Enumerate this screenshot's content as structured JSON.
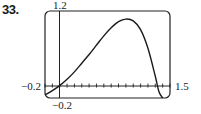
{
  "problem_number": "33.",
  "chart_data": {
    "type": "line",
    "title": "",
    "xlabel": "",
    "ylabel": "",
    "xlim": [
      -0.2,
      1.5
    ],
    "ylim": [
      -0.2,
      1.2
    ],
    "tick_labels": {
      "y_max": "1.2",
      "x_min": "-0.2",
      "x_max": "1.5",
      "y_min": "-0.2"
    },
    "x_tick_step": 0.1,
    "grid": false,
    "legend": null,
    "series": [
      {
        "name": "f(x)",
        "x": [
          -0.2,
          -0.1,
          0.0,
          0.1,
          0.2,
          0.3,
          0.4,
          0.5,
          0.6,
          0.7,
          0.8,
          0.9,
          1.0,
          1.1,
          1.2,
          1.3,
          1.35,
          1.4
        ],
        "y": [
          -0.15,
          -0.08,
          0.0,
          0.1,
          0.22,
          0.36,
          0.5,
          0.65,
          0.8,
          0.93,
          1.03,
          1.07,
          1.04,
          0.9,
          0.6,
          0.15,
          -0.1,
          -0.2
        ]
      }
    ]
  },
  "labels": {
    "y_top": "1.2",
    "x_left": "−0.2",
    "x_right": "1.5",
    "y_bottom": "−0.2"
  }
}
